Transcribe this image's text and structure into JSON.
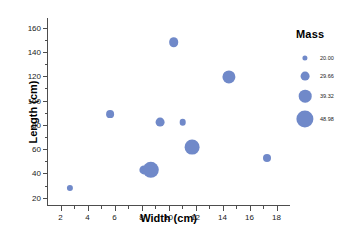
{
  "chart_data": {
    "type": "scatter",
    "title": "",
    "xlabel": "Width (cm)",
    "ylabel": "Length (cm)",
    "xlim": [
      1.0,
      19.0
    ],
    "ylim": [
      14.0,
      168.0
    ],
    "grid": false,
    "x_ticks": [
      2,
      4,
      6,
      8,
      10,
      12,
      14,
      16,
      18
    ],
    "x_tick_labels": [
      "2",
      "4",
      "6",
      "8",
      "10",
      "12",
      "14",
      "16",
      "18"
    ],
    "x_minor_ticks": [
      3,
      5,
      7,
      9,
      11,
      13,
      15,
      17
    ],
    "y_ticks": [
      20,
      40,
      60,
      80,
      100,
      120,
      140,
      160
    ],
    "y_tick_labels": [
      "20",
      "40",
      "60",
      "80",
      "100",
      "120",
      "140",
      "160"
    ],
    "y_minor_ticks": [
      30,
      50,
      70,
      90,
      110,
      130,
      150
    ],
    "size_encoding": "Mass",
    "marker_color": "#7089c9",
    "points": [
      {
        "x": 2.7,
        "y": 28.0,
        "mass": 21.0,
        "r": 3.1
      },
      {
        "x": 5.65,
        "y": 89.0,
        "mass": 24.5,
        "r": 3.9
      },
      {
        "x": 8.2,
        "y": 43.0,
        "mass": 30.0,
        "r": 4.6
      },
      {
        "x": 8.7,
        "y": 43.0,
        "mass": 46.0,
        "r": 8.2
      },
      {
        "x": 9.35,
        "y": 82.0,
        "mass": 27.5,
        "r": 4.4
      },
      {
        "x": 10.4,
        "y": 148.0,
        "mass": 29.0,
        "r": 4.8
      },
      {
        "x": 11.05,
        "y": 82.0,
        "mass": 21.5,
        "r": 3.3
      },
      {
        "x": 11.75,
        "y": 62.0,
        "mass": 43.0,
        "r": 7.4
      },
      {
        "x": 14.5,
        "y": 119.5,
        "mass": 40.0,
        "r": 6.6
      },
      {
        "x": 17.3,
        "y": 53.0,
        "mass": 25.0,
        "r": 4.0
      }
    ],
    "legend": {
      "title": "Mass",
      "position": "right",
      "entries": [
        {
          "label": "20.00",
          "value": 20.0,
          "r": 2.6
        },
        {
          "label": "29.66",
          "value": 29.66,
          "r": 4.4
        },
        {
          "label": "39.32",
          "value": 39.32,
          "r": 6.3
        },
        {
          "label": "48.98",
          "value": 48.98,
          "r": 8.6
        }
      ]
    }
  }
}
